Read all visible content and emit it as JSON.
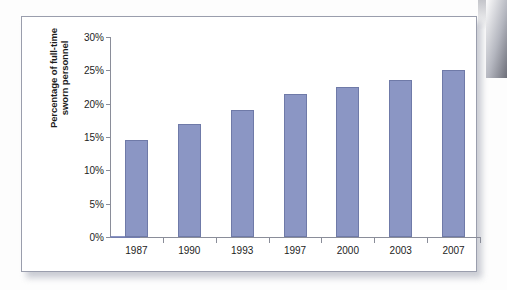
{
  "figure": {
    "frame_color": "#9a9ead",
    "background": "#ffffff"
  },
  "chart_data": {
    "type": "bar",
    "title": "",
    "subtitle": "",
    "xlabel": "",
    "ylabel": "Percentage of full-time\nsworn personnel",
    "categories": [
      "1987",
      "1990",
      "1993",
      "1997",
      "2000",
      "2003",
      "2007"
    ],
    "values": [
      14.5,
      17.0,
      19.0,
      21.5,
      22.5,
      23.5,
      25.0
    ],
    "value_suffix": "%",
    "ylim": [
      0,
      30
    ],
    "y_ticks": [
      "0%",
      "5%",
      "10%",
      "15%",
      "20%",
      "25%",
      "30%"
    ],
    "y_tick_values": [
      0,
      5,
      10,
      15,
      20,
      25,
      30
    ],
    "grid": false,
    "legend": null,
    "legend_position": "none",
    "bar_color": "#8b96c4",
    "bar_border_color": "#6f7aa8",
    "axis_color": "#8a8d99"
  }
}
